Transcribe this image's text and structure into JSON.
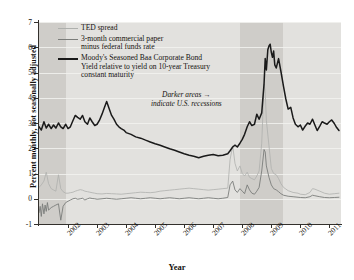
{
  "chart_data": {
    "type": "line",
    "title": "",
    "xlabel": "Year",
    "ylabel": "Percent monthly, not seasonally adjusted",
    "xlim": [
      2001.0,
      2011.4
    ],
    "ylim": [
      -1,
      7
    ],
    "grid": true,
    "legend_position": "top-left",
    "xticks": [
      "2002",
      "2003",
      "2004",
      "2005",
      "2006",
      "2007",
      "2008",
      "2009",
      "2010",
      "2011"
    ],
    "xtick_values": [
      2002,
      2003,
      2004,
      2005,
      2006,
      2007,
      2008,
      2009,
      2010,
      2011
    ],
    "yticks": [
      "-1",
      "0",
      "1",
      "2",
      "3",
      "4",
      "5",
      "6",
      "7"
    ],
    "ytick_values": [
      -1,
      0,
      1,
      2,
      3,
      4,
      5,
      6,
      7
    ],
    "annotations": [
      {
        "text": "Darker areas",
        "text2": "indicate U.S. recessions",
        "arrow": "→",
        "x": 2007.2,
        "y": 3.6
      }
    ],
    "shaded_regions": [
      {
        "label": "2001 recession",
        "x0": 2001.0,
        "x1": 2001.92,
        "color": "#cfcdc9"
      },
      {
        "label": "2007-2009 recession",
        "x0": 2007.92,
        "x1": 2009.42,
        "color": "#cfcdc9"
      }
    ],
    "series": [
      {
        "name": "TED spread",
        "color": "#aeb0ad",
        "width": 0.8,
        "x": [
          2001.0,
          2001.08,
          2001.17,
          2001.25,
          2001.33,
          2001.42,
          2001.5,
          2001.58,
          2001.67,
          2001.75,
          2001.83,
          2001.92,
          2002.0,
          2002.08,
          2002.17,
          2002.25,
          2002.33,
          2002.42,
          2002.5,
          2002.58,
          2002.67,
          2002.75,
          2002.83,
          2002.92,
          2003.0,
          2003.17,
          2003.33,
          2003.5,
          2003.67,
          2003.83,
          2004.0,
          2004.17,
          2004.33,
          2004.5,
          2004.67,
          2004.83,
          2005.0,
          2005.17,
          2005.33,
          2005.5,
          2005.67,
          2005.83,
          2006.0,
          2006.17,
          2006.33,
          2006.5,
          2006.67,
          2006.83,
          2007.0,
          2007.17,
          2007.33,
          2007.5,
          2007.58,
          2007.67,
          2007.75,
          2007.83,
          2007.92,
          2008.0,
          2008.08,
          2008.17,
          2008.25,
          2008.33,
          2008.42,
          2008.5,
          2008.58,
          2008.67,
          2008.75,
          2008.79,
          2008.83,
          2008.92,
          2009.0,
          2009.08,
          2009.17,
          2009.25,
          2009.33,
          2009.42,
          2009.58,
          2009.75,
          2009.92,
          2010.0,
          2010.17,
          2010.33,
          2010.42,
          2010.5,
          2010.67,
          2010.83,
          2011.0,
          2011.17,
          2011.33
        ],
        "y": [
          0.45,
          0.55,
          0.7,
          1.05,
          0.6,
          0.4,
          0.35,
          0.3,
          0.95,
          0.4,
          0.28,
          0.22,
          0.22,
          0.24,
          0.26,
          0.3,
          0.33,
          0.36,
          0.34,
          0.3,
          0.28,
          0.26,
          0.24,
          0.22,
          0.2,
          0.19,
          0.21,
          0.2,
          0.19,
          0.18,
          0.2,
          0.22,
          0.24,
          0.26,
          0.25,
          0.24,
          0.26,
          0.3,
          0.32,
          0.34,
          0.36,
          0.38,
          0.4,
          0.42,
          0.4,
          0.38,
          0.36,
          0.34,
          0.36,
          0.38,
          0.4,
          0.42,
          1.55,
          2.1,
          1.4,
          1.1,
          1.3,
          1.0,
          0.9,
          1.05,
          0.85,
          0.8,
          0.75,
          0.9,
          1.1,
          2.2,
          4.55,
          4.25,
          3.1,
          2.1,
          1.2,
          1.0,
          0.95,
          0.8,
          0.6,
          0.45,
          0.32,
          0.25,
          0.22,
          0.18,
          0.16,
          0.25,
          0.4,
          0.38,
          0.3,
          0.22,
          0.18,
          0.2,
          0.22
        ]
      },
      {
        "name": "3-month commercial paper minus federal funds rate",
        "color": "#7b7d7a",
        "width": 0.9,
        "x": [
          2001.0,
          2001.04,
          2001.08,
          2001.12,
          2001.17,
          2001.21,
          2001.25,
          2001.29,
          2001.33,
          2001.42,
          2001.5,
          2001.58,
          2001.67,
          2001.75,
          2001.83,
          2001.92,
          2002.0,
          2002.08,
          2002.17,
          2002.25,
          2002.33,
          2002.42,
          2002.5,
          2002.58,
          2002.67,
          2002.75,
          2002.83,
          2002.92,
          2003.0,
          2003.17,
          2003.33,
          2003.5,
          2003.67,
          2003.83,
          2004.0,
          2004.17,
          2004.33,
          2004.5,
          2004.67,
          2004.83,
          2005.0,
          2005.17,
          2005.33,
          2005.5,
          2005.67,
          2005.83,
          2006.0,
          2006.17,
          2006.33,
          2006.5,
          2006.67,
          2006.83,
          2007.0,
          2007.17,
          2007.33,
          2007.5,
          2007.58,
          2007.67,
          2007.75,
          2007.83,
          2007.92,
          2008.0,
          2008.08,
          2008.17,
          2008.25,
          2008.33,
          2008.42,
          2008.5,
          2008.58,
          2008.67,
          2008.75,
          2008.79,
          2008.83,
          2008.92,
          2009.0,
          2009.08,
          2009.17,
          2009.25,
          2009.33,
          2009.42,
          2009.58,
          2009.75,
          2009.92,
          2010.0,
          2010.17,
          2010.33,
          2010.42,
          2010.5,
          2010.67,
          2010.83,
          2011.0,
          2011.17,
          2011.33
        ],
        "y": [
          -0.55,
          -0.3,
          -0.7,
          -0.2,
          -0.6,
          -0.25,
          -0.5,
          -0.15,
          -0.45,
          -0.35,
          -0.3,
          -0.25,
          -0.2,
          -0.85,
          -0.3,
          -0.15,
          -0.1,
          -0.05,
          0.0,
          0.02,
          -0.02,
          0.0,
          0.02,
          -0.05,
          0.0,
          0.03,
          0.01,
          0.0,
          -0.02,
          0.0,
          0.02,
          0.0,
          -0.02,
          0.0,
          0.02,
          0.04,
          0.02,
          0.0,
          0.02,
          0.04,
          0.02,
          0.0,
          0.02,
          0.04,
          0.02,
          0.0,
          0.02,
          0.04,
          0.02,
          0.0,
          0.02,
          0.04,
          0.02,
          0.0,
          0.02,
          0.05,
          0.55,
          0.7,
          0.35,
          0.25,
          0.4,
          0.3,
          0.2,
          0.55,
          0.35,
          0.22,
          0.18,
          0.3,
          0.45,
          1.1,
          1.95,
          1.85,
          1.3,
          0.85,
          0.55,
          0.4,
          0.35,
          0.28,
          0.2,
          0.14,
          0.1,
          0.08,
          0.06,
          0.05,
          0.04,
          0.08,
          0.14,
          0.12,
          0.08,
          0.05,
          0.04,
          0.05,
          0.06
        ]
      },
      {
        "name": "Moody's Seasoned Baa Corporate Bond Yield relative to yield on 10-year Treasury constant maturity",
        "color": "#1a1a1a",
        "width": 1.5,
        "x": [
          2001.0,
          2001.08,
          2001.17,
          2001.25,
          2001.33,
          2001.42,
          2001.5,
          2001.58,
          2001.67,
          2001.75,
          2001.83,
          2001.92,
          2002.0,
          2002.08,
          2002.17,
          2002.25,
          2002.33,
          2002.42,
          2002.5,
          2002.58,
          2002.67,
          2002.75,
          2002.83,
          2002.92,
          2003.0,
          2003.08,
          2003.17,
          2003.25,
          2003.33,
          2003.42,
          2003.5,
          2003.58,
          2003.67,
          2003.75,
          2003.83,
          2003.92,
          2004.0,
          2004.17,
          2004.33,
          2004.5,
          2004.67,
          2004.83,
          2005.0,
          2005.17,
          2005.33,
          2005.5,
          2005.67,
          2005.83,
          2006.0,
          2006.17,
          2006.33,
          2006.5,
          2006.67,
          2006.83,
          2007.0,
          2007.17,
          2007.33,
          2007.5,
          2007.58,
          2007.67,
          2007.75,
          2007.83,
          2007.92,
          2008.0,
          2008.08,
          2008.17,
          2008.25,
          2008.33,
          2008.42,
          2008.5,
          2008.58,
          2008.67,
          2008.75,
          2008.79,
          2008.83,
          2008.88,
          2008.92,
          2008.96,
          2009.0,
          2009.04,
          2009.08,
          2009.12,
          2009.17,
          2009.25,
          2009.33,
          2009.42,
          2009.5,
          2009.58,
          2009.67,
          2009.75,
          2009.83,
          2009.92,
          2010.0,
          2010.08,
          2010.17,
          2010.25,
          2010.33,
          2010.42,
          2010.5,
          2010.58,
          2010.67,
          2010.75,
          2010.83,
          2010.92,
          2011.0,
          2011.08,
          2011.17,
          2011.25,
          2011.33
        ],
        "y": [
          2.85,
          2.72,
          3.05,
          2.8,
          2.95,
          2.78,
          2.92,
          2.8,
          3.0,
          2.85,
          2.78,
          2.95,
          2.78,
          2.85,
          3.1,
          3.3,
          3.22,
          3.15,
          3.3,
          3.05,
          2.95,
          3.2,
          3.05,
          2.9,
          2.95,
          3.1,
          3.35,
          3.6,
          3.85,
          3.55,
          3.3,
          3.15,
          2.95,
          2.85,
          2.78,
          2.72,
          2.62,
          2.55,
          2.45,
          2.4,
          2.32,
          2.25,
          2.18,
          2.12,
          2.05,
          1.98,
          1.92,
          1.85,
          1.78,
          1.72,
          1.68,
          1.62,
          1.68,
          1.72,
          1.75,
          1.7,
          1.72,
          1.78,
          1.9,
          2.05,
          2.12,
          2.05,
          2.2,
          2.35,
          2.55,
          2.85,
          3.05,
          2.9,
          2.95,
          3.35,
          3.15,
          3.4,
          4.55,
          5.55,
          5.1,
          5.9,
          6.05,
          6.12,
          5.8,
          5.6,
          5.85,
          5.3,
          5.18,
          5.55,
          5.05,
          4.45,
          3.95,
          3.55,
          3.62,
          3.2,
          2.95,
          2.85,
          2.92,
          2.72,
          2.88,
          3.0,
          2.95,
          3.15,
          2.92,
          2.7,
          2.88,
          3.05,
          3.0,
          2.95,
          3.05,
          3.12,
          2.98,
          2.82,
          2.7
        ]
      }
    ]
  },
  "legend": {
    "entries": [
      {
        "label": "TED spread",
        "key": "ted"
      },
      {
        "label": "3-month commercial paper\nminus federal funds rate",
        "key": "cp"
      },
      {
        "label": "Moody's Seasoned Baa Corporate Bond\nYield relative to yield on 10-year Treasury\nconstant maturity",
        "key": "baa"
      }
    ]
  },
  "annotation": {
    "line1": "Darker areas",
    "line2": "indicate U.S. recessions",
    "arrow": "→"
  },
  "axes": {
    "x_title": "Year",
    "y_title": "Percent monthly, not seasonally adjusted"
  },
  "colors": {
    "plot_background": "#e2e1de",
    "recession_band": "#cfcdc9",
    "ted": "#aeb0ad",
    "commercial_paper": "#7b7d7a",
    "baa": "#1a1a1a",
    "axis": "#33302c",
    "text": "#15120f"
  }
}
